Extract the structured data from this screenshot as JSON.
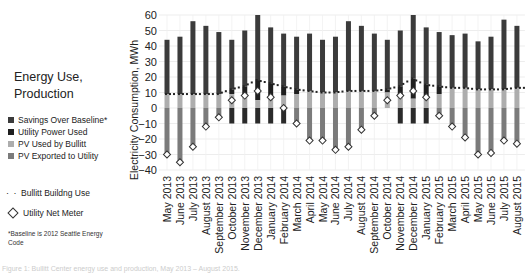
{
  "legend": {
    "title_line1": "Energy Use,",
    "title_line2": "Production",
    "items": [
      {
        "label": "Savings Over Baseline*",
        "color": "#3b3b3b"
      },
      {
        "label": "Utility Power Used",
        "color": "#1f1f1f"
      },
      {
        "label": "PV Used by Bullitt",
        "color": "#adadad"
      },
      {
        "label": "PV Exported to Utility",
        "color": "#7b7b7b"
      }
    ],
    "line_items": [
      {
        "label": "Bullitt Buildng Use",
        "marker": "dotted-line"
      },
      {
        "label": "Utility Net Meter",
        "marker": "diamond"
      }
    ],
    "note": "*Baseline is 2012 Seattle Energy Code"
  },
  "caption": "Figure 1: Bullitt Center energy use and production, May 2013 – August 2015.",
  "chart_data": {
    "type": "bar",
    "title": "Energy Use, Production",
    "xlabel": "",
    "ylabel": "Electricity Consumption, MWh",
    "ylim": [
      -40,
      60
    ],
    "yticks": [
      60,
      50,
      40,
      30,
      20,
      10,
      0,
      -10,
      -20,
      -30,
      -40
    ],
    "grid": true,
    "legend_position": "left",
    "categories": [
      "May 2013",
      "June 2013",
      "July 2013",
      "August 2013",
      "September 2013",
      "October 2013",
      "November 2013",
      "December 2013",
      "January 2014",
      "February 2014",
      "March 2014",
      "April 2014",
      "May 2014",
      "June 2014",
      "July 2014",
      "August 2014",
      "September 2014",
      "October 2014",
      "November 2014",
      "December 2014",
      "January 2015",
      "February 2015",
      "March 2015",
      "April 2015",
      "May 2015",
      "June 2015",
      "July 2015",
      "August 2015"
    ],
    "series": [
      {
        "name": "Baseline total (bar top)",
        "values": [
          44,
          46,
          56,
          53,
          49,
          44,
          50,
          60,
          52,
          48,
          46,
          48,
          44,
          46,
          56,
          53,
          48,
          44,
          50,
          60,
          52,
          49,
          47,
          48,
          43,
          46,
          57,
          53
        ]
      },
      {
        "name": "Bullitt Buildng Use",
        "values": [
          9,
          9,
          9,
          9,
          9,
          12,
          14,
          18,
          16,
          14,
          12,
          11,
          10,
          10,
          11,
          11,
          11,
          12,
          14,
          19,
          15,
          14,
          13,
          13,
          12,
          12,
          12,
          13
        ]
      },
      {
        "name": "PV Used by Bullitt",
        "values": [
          9,
          9,
          9,
          9,
          9,
          9,
          7,
          5,
          6,
          8,
          9,
          11,
          10,
          10,
          11,
          11,
          11,
          10,
          8,
          6,
          7,
          9,
          13,
          13,
          12,
          12,
          12,
          13
        ]
      },
      {
        "name": "Utility Net Meter",
        "values": [
          -30,
          -35,
          -25,
          -12,
          -6,
          5,
          8,
          11,
          7,
          0,
          -10,
          -21,
          -21,
          -27,
          -25,
          -14,
          -5,
          5,
          8,
          11,
          7,
          -5,
          -12,
          -19,
          -30,
          -29,
          -21,
          -23
        ]
      },
      {
        "name": "Utility below zero",
        "values": [
          0,
          0,
          0,
          0,
          0,
          -10,
          -10,
          -10,
          -10,
          -10,
          0,
          0,
          0,
          0,
          0,
          0,
          0,
          0,
          -10,
          -10,
          -10,
          0,
          0,
          0,
          0,
          0,
          0,
          0
        ]
      }
    ]
  }
}
